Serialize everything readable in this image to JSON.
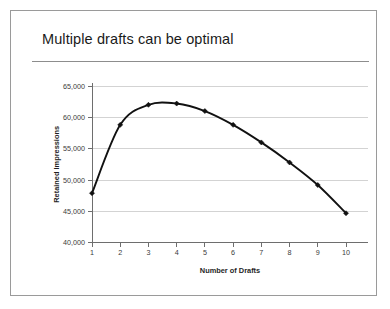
{
  "slide": {
    "title": "Multiple drafts can be optimal"
  },
  "chart_data": {
    "type": "line",
    "title": "",
    "xlabel": "Number of Drafts",
    "ylabel": "Retained Impressions",
    "x": [
      1,
      2,
      3,
      4,
      5,
      6,
      7,
      8,
      9,
      10
    ],
    "xticklabels": [
      "1",
      "2",
      "3",
      "4",
      "5",
      "6",
      "7",
      "8",
      "9",
      "10"
    ],
    "values": [
      47900,
      58800,
      62000,
      62200,
      61000,
      58800,
      56000,
      52800,
      49200,
      44700
    ],
    "yticks": [
      40000,
      45000,
      50000,
      55000,
      60000,
      65000
    ],
    "yticklabels": [
      "40,000",
      "45,000",
      "50,000",
      "55,000",
      "60,000",
      "65,000"
    ],
    "ylim": [
      40000,
      65000
    ],
    "xlim": [
      1,
      10
    ],
    "grid": "horizontal",
    "legend": "none",
    "marker": "diamond",
    "smoothing": "spline",
    "line_color": "#111111",
    "marker_color": "#111111",
    "grid_color": "#c8c8c8",
    "axis_color": "#6e6e6e",
    "background_color": "#ffffff"
  }
}
